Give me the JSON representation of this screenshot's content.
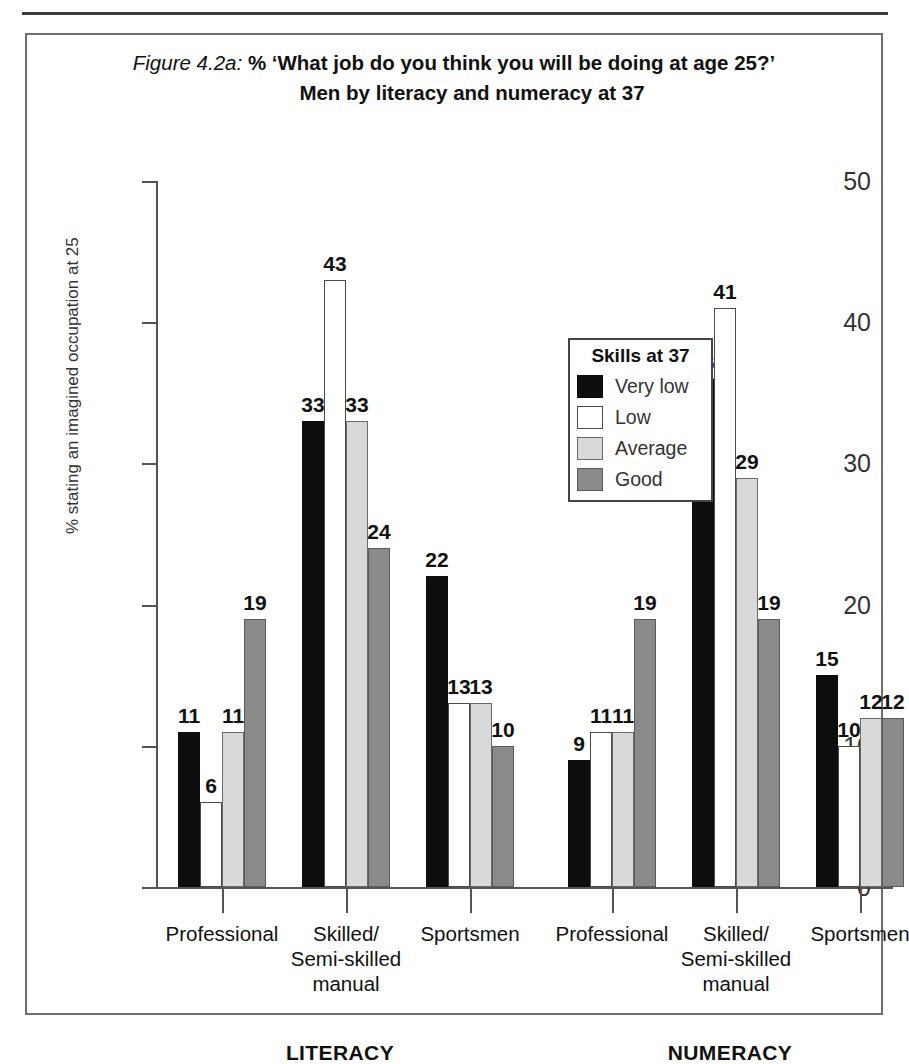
{
  "figure": {
    "number_label": "Figure 4.2a:",
    "title_line1": " % ‘What job do you think you will be doing at age 25?’",
    "title_line2": "Men by literacy and numeracy at 37"
  },
  "legend": {
    "title": "Skills at 37",
    "entries": [
      {
        "label": "Very low",
        "color": "#0d0d0d"
      },
      {
        "label": "Low",
        "color": "#ffffff"
      },
      {
        "label": "Average",
        "color": "#d9d9d9"
      },
      {
        "label": "Good",
        "color": "#8a8a8a"
      }
    ]
  },
  "axis": {
    "y_title": "% stating an imagined occupation at 25",
    "y_ticks": [
      "0",
      "10",
      "20",
      "30",
      "40",
      "50"
    ]
  },
  "group_labels": [
    "LITERACY",
    "NUMERACY"
  ],
  "chart_data": {
    "type": "bar",
    "title": "Figure 4.2a: % ‘What job do you think you will be doing at age 25?’ Men by literacy and numeracy at 37",
    "xlabel": "",
    "ylabel": "% stating an imagined occupation at 25",
    "ylim": [
      0,
      50
    ],
    "ytick_step": 10,
    "grid": false,
    "legend_position": "inside-top-center",
    "legend_title": "Skills at 37",
    "panels": [
      "LITERACY",
      "NUMERACY"
    ],
    "categories": [
      "Professional",
      "Skilled/\nSemi-skilled\nmanual",
      "Sportsmen"
    ],
    "series_names": [
      "Very low",
      "Low",
      "Average",
      "Good"
    ],
    "series": [
      {
        "panel": "LITERACY",
        "values": [
          {
            "category": "Professional",
            "Very low": 11,
            "Low": 6,
            "Average": 11,
            "Good": 19
          },
          {
            "category": "Skilled/Semi-skilled manual",
            "Very low": 33,
            "Low": 43,
            "Average": 33,
            "Good": 24
          },
          {
            "category": "Sportsmen",
            "Very low": 22,
            "Low": 13,
            "Average": 13,
            "Good": 10
          }
        ]
      },
      {
        "panel": "NUMERACY",
        "values": [
          {
            "category": "Professional",
            "Very low": 9,
            "Low": 11,
            "Average": 11,
            "Good": 19
          },
          {
            "category": "Skilled/Semi-skilled manual",
            "Very low": 36,
            "Low": 41,
            "Average": 29,
            "Good": 19
          },
          {
            "category": "Sportsmen",
            "Very low": 15,
            "Low": 10,
            "Average": 12,
            "Good": 12
          }
        ]
      }
    ]
  }
}
